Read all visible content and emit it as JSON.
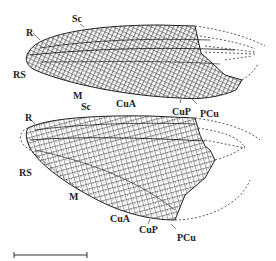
{
  "figure": {
    "type": "insect wing venation drawing",
    "upper_wing": {
      "labels": [
        {
          "text": "Sc",
          "x": 72,
          "y": 14
        },
        {
          "text": "R",
          "x": 26,
          "y": 28
        },
        {
          "text": "RS",
          "x": 13,
          "y": 70
        },
        {
          "text": "M",
          "x": 73,
          "y": 91
        },
        {
          "text": "CuA",
          "x": 116,
          "y": 99
        },
        {
          "text": "CuP",
          "x": 172,
          "y": 107
        },
        {
          "text": "PCu",
          "x": 200,
          "y": 109
        }
      ]
    },
    "lower_wing": {
      "labels": [
        {
          "text": "Sc",
          "x": 81,
          "y": 102
        },
        {
          "text": "R",
          "x": 25,
          "y": 113
        },
        {
          "text": "RS",
          "x": 19,
          "y": 168
        },
        {
          "text": "M",
          "x": 69,
          "y": 192
        },
        {
          "text": "CuA",
          "x": 110,
          "y": 214
        },
        {
          "text": "CuP",
          "x": 139,
          "y": 225
        },
        {
          "text": "PCu",
          "x": 177,
          "y": 233
        }
      ]
    },
    "scale_bar": {
      "x1": 14,
      "x2": 87,
      "y": 255
    },
    "colors": {
      "ink": "#222222",
      "background": "#ffffff"
    }
  }
}
